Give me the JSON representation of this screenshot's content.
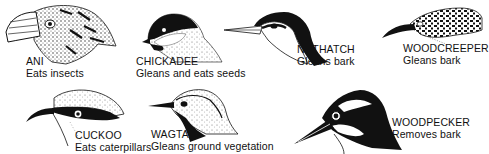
{
  "figure": {
    "birds": [
      {
        "name": "ANI",
        "description": "Eats insects"
      },
      {
        "name": "CHICKADEE",
        "description": "Gleans and eats seeds"
      },
      {
        "name": "NUTHATCH",
        "description": "Gleans bark"
      },
      {
        "name": "WOODCREEPER",
        "description": "Gleans bark"
      },
      {
        "name": "CUCKOO",
        "description": "Eats caterpillars"
      },
      {
        "name": "WAGTAIL",
        "description": "Gleans ground vegetation"
      },
      {
        "name": "WOODPECKER",
        "description": "Removes bark"
      }
    ]
  }
}
